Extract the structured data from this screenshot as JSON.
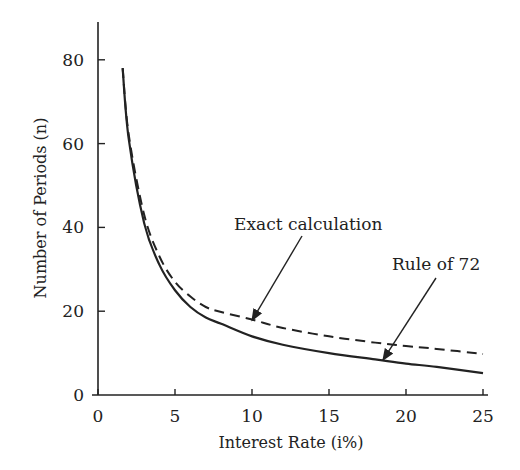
{
  "chart_data": {
    "type": "line",
    "title": "",
    "xlabel": "Interest Rate (i%)",
    "ylabel": "Number of Periods (n)",
    "xlim": [
      0,
      25
    ],
    "ylim": [
      0,
      88
    ],
    "xticks": [
      0,
      5,
      10,
      15,
      20,
      25
    ],
    "yticks": [
      0,
      20,
      40,
      60,
      80
    ],
    "grid": false,
    "legend": "none (inline annotations with arrows)",
    "series": [
      {
        "name": "Exact calculation",
        "style": "dashed",
        "x": [
          1.6,
          2,
          3,
          4,
          5,
          6,
          7,
          8,
          10,
          12,
          15,
          18,
          20,
          22,
          25
        ],
        "values": [
          78,
          62,
          43,
          33,
          27,
          23.5,
          21,
          19.8,
          18,
          16,
          14,
          12.5,
          11.7,
          11,
          9.8
        ]
      },
      {
        "name": "Rule of 72",
        "style": "solid",
        "x": [
          1.6,
          2,
          3,
          4,
          5,
          6,
          7,
          8,
          10,
          12,
          15,
          18,
          20,
          22,
          25
        ],
        "values": [
          78,
          61,
          41,
          31,
          25,
          21,
          18.5,
          17,
          14,
          12,
          10,
          8.5,
          7.5,
          6.7,
          5.2
        ]
      }
    ],
    "annotations": [
      {
        "text": "Exact calculation",
        "arrow_to": {
          "x": 10,
          "y": 17.8
        }
      },
      {
        "text": "Rule of 72",
        "arrow_to": {
          "x": 18.5,
          "y": 8.3
        }
      }
    ]
  }
}
